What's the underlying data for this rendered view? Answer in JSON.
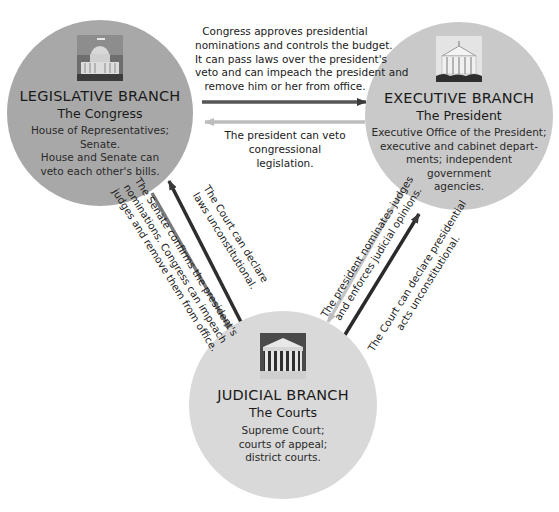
{
  "diagram": {
    "colors": {
      "legislative_fill": "#a8a8a8",
      "executive_fill": "#c9c9c9",
      "judicial_fill": "#d9d9d9",
      "dark_arrow": "#3a3a3a",
      "medium_arrow": "#7a7a7a",
      "light_arrow": "#bdbdbd"
    }
  },
  "branches": {
    "legislative": {
      "icon": "capitol-building-icon",
      "title": "LEGISLATIVE BRANCH",
      "subtitle": "The Congress",
      "desc": [
        "House of Representatives;",
        "Senate.",
        "House and Senate can",
        "veto each other's bills."
      ]
    },
    "executive": {
      "icon": "white-house-icon",
      "title": "EXECUTIVE BRANCH",
      "subtitle": "The President",
      "desc": [
        "Executive Office of the President;",
        "executive and cabinet depart-",
        "ments; independent",
        "government",
        "agencies."
      ]
    },
    "judicial": {
      "icon": "supreme-court-building-icon",
      "title": "JUDICIAL BRANCH",
      "subtitle": "The Courts",
      "desc": [
        "Supreme Court;",
        "courts of appeal;",
        "district courts."
      ]
    }
  },
  "relations": {
    "legislative_to_executive": {
      "direction": "legislative → executive",
      "lines": [
        "Congress approves presidential",
        "nominations and controls the budget.",
        "It can pass laws over the president's",
        "veto and can impeach the president and",
        "remove him or her from office."
      ]
    },
    "executive_to_legislative": {
      "direction": "executive → legislative",
      "lines": [
        "The president can veto",
        "congressional",
        "legislation."
      ]
    },
    "legislative_to_judicial": {
      "direction": "legislative → judicial",
      "lines": [
        "The Senate confirms the president's",
        "nominations. Congress can impeach",
        "judges and remove them from office."
      ]
    },
    "judicial_to_legislative": {
      "direction": "judicial → legislative",
      "lines": [
        "The Court can declare",
        "laws unconstitutional."
      ]
    },
    "executive_to_judicial": {
      "direction": "executive → judicial",
      "lines": [
        "The president nominates judges",
        "and enforces judicial opinions."
      ]
    },
    "judicial_to_executive": {
      "direction": "judicial → executive",
      "lines": [
        "The Court can declare presidential",
        "acts unconstitutional."
      ]
    }
  }
}
